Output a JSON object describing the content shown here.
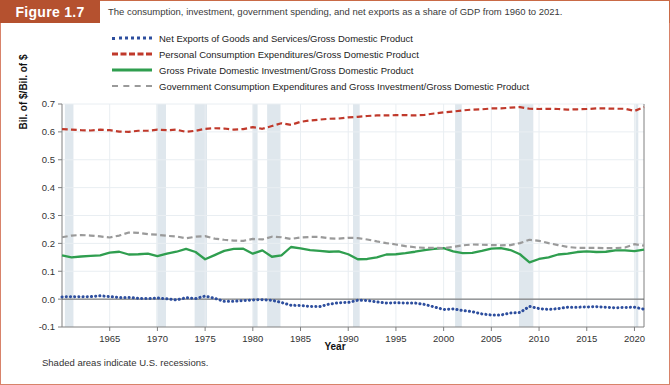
{
  "header": {
    "figure_tag": "Figure 1.7",
    "caption": "The consumption, investment, government spending, and net exports as a share of GDP from 1960 to 2021."
  },
  "footnote": "Shaded areas indicate U.S. recessions.",
  "colors": {
    "header_bg": "#b5512f",
    "frame_border": "#d8836a",
    "net_exports": "#2d4e9e",
    "consumption": "#c0392b",
    "investment": "#2f9e4f",
    "government": "#9a9a9a",
    "recession_band": "#dfe7ed",
    "gridline": "#e9eef2",
    "axis": "#808080"
  },
  "legend": {
    "position": "top",
    "items": [
      {
        "label": "Net Exports of Goods and Services/Gross Domestic Product",
        "style": "dotted",
        "color": "#2d4e9e",
        "swatch_class": "sw-dotted"
      },
      {
        "label": "Personal Consumption Expenditures/Gross Domestic Product",
        "style": "dashed",
        "color": "#c0392b",
        "swatch_class": "sw-dashed-red"
      },
      {
        "label": "Gross Private Domestic Investment/Gross Domestic Product",
        "style": "solid",
        "color": "#2f9e4f",
        "swatch_class": "sw-solid-green"
      },
      {
        "label": "Government Consumption Expenditures and Gross Investment/Gross Domestic Product",
        "style": "dashed",
        "color": "#9a9a9a",
        "swatch_class": "sw-dashed-gray"
      }
    ]
  },
  "chart_data": {
    "type": "line",
    "title": "The consumption, investment, government spending, and net exports as a share of GDP from 1960 to 2021.",
    "xlabel": "Year",
    "ylabel": "Bil. of $/Bil. of $",
    "xlim": [
      1960,
      2021
    ],
    "ylim": [
      -0.1,
      0.7
    ],
    "ytick_values": [
      -0.1,
      0.0,
      0.1,
      0.2,
      0.3,
      0.4,
      0.5,
      0.6,
      0.7
    ],
    "ytick_labels": [
      "-0.1",
      "0.0",
      "0.1",
      "0.2",
      "0.3",
      "0.4",
      "0.5",
      "0.6",
      "0.7"
    ],
    "xtick_values": [
      1965,
      1970,
      1975,
      1980,
      1985,
      1990,
      1995,
      2000,
      2005,
      2010,
      2015,
      2020
    ],
    "xtick_labels": [
      "1965",
      "1970",
      "1975",
      "1980",
      "1985",
      "1990",
      "1995",
      "2000",
      "2005",
      "2010",
      "2015",
      "2020"
    ],
    "grid": true,
    "legend_position": "above-plot",
    "x": [
      1960,
      1961,
      1962,
      1963,
      1964,
      1965,
      1966,
      1967,
      1968,
      1969,
      1970,
      1971,
      1972,
      1973,
      1974,
      1975,
      1976,
      1977,
      1978,
      1979,
      1980,
      1981,
      1982,
      1983,
      1984,
      1985,
      1986,
      1987,
      1988,
      1989,
      1990,
      1991,
      1992,
      1993,
      1994,
      1995,
      1996,
      1997,
      1998,
      1999,
      2000,
      2001,
      2002,
      2003,
      2004,
      2005,
      2006,
      2007,
      2008,
      2009,
      2010,
      2011,
      2012,
      2013,
      2014,
      2015,
      2016,
      2017,
      2018,
      2019,
      2020,
      2021
    ],
    "series": [
      {
        "name": "Net Exports of Goods and Services/Gross Domestic Product",
        "color": "#2d4e9e",
        "style": "dotted",
        "values": [
          0.008,
          0.009,
          0.008,
          0.009,
          0.012,
          0.009,
          0.006,
          0.006,
          0.003,
          0.002,
          0.004,
          0.001,
          -0.003,
          0.005,
          0.002,
          0.011,
          0.003,
          -0.008,
          -0.008,
          -0.005,
          -0.003,
          -0.002,
          -0.004,
          -0.012,
          -0.022,
          -0.023,
          -0.026,
          -0.027,
          -0.018,
          -0.013,
          -0.012,
          -0.004,
          -0.005,
          -0.01,
          -0.014,
          -0.013,
          -0.014,
          -0.014,
          -0.019,
          -0.028,
          -0.037,
          -0.035,
          -0.041,
          -0.045,
          -0.053,
          -0.057,
          -0.057,
          -0.05,
          -0.048,
          -0.026,
          -0.034,
          -0.037,
          -0.034,
          -0.029,
          -0.029,
          -0.028,
          -0.027,
          -0.029,
          -0.031,
          -0.03,
          -0.029,
          -0.036
        ]
      },
      {
        "name": "Personal Consumption Expenditures/Gross Domestic Product",
        "color": "#c0392b",
        "style": "dashed",
        "values": [
          0.61,
          0.608,
          0.606,
          0.605,
          0.608,
          0.606,
          0.601,
          0.6,
          0.604,
          0.604,
          0.608,
          0.606,
          0.608,
          0.6,
          0.604,
          0.611,
          0.613,
          0.612,
          0.608,
          0.61,
          0.617,
          0.611,
          0.621,
          0.631,
          0.625,
          0.636,
          0.641,
          0.644,
          0.647,
          0.648,
          0.652,
          0.654,
          0.657,
          0.659,
          0.659,
          0.66,
          0.66,
          0.659,
          0.661,
          0.666,
          0.67,
          0.673,
          0.677,
          0.68,
          0.681,
          0.684,
          0.684,
          0.687,
          0.689,
          0.683,
          0.682,
          0.683,
          0.682,
          0.68,
          0.681,
          0.682,
          0.684,
          0.684,
          0.683,
          0.683,
          0.675,
          0.689
        ]
      },
      {
        "name": "Gross Private Domestic Investment/Gross Domestic Product",
        "color": "#2f9e4f",
        "style": "solid",
        "values": [
          0.157,
          0.15,
          0.153,
          0.155,
          0.157,
          0.167,
          0.17,
          0.16,
          0.161,
          0.163,
          0.154,
          0.163,
          0.17,
          0.18,
          0.169,
          0.143,
          0.158,
          0.173,
          0.18,
          0.181,
          0.163,
          0.175,
          0.152,
          0.157,
          0.187,
          0.182,
          0.176,
          0.173,
          0.17,
          0.171,
          0.161,
          0.143,
          0.144,
          0.15,
          0.16,
          0.161,
          0.165,
          0.17,
          0.176,
          0.18,
          0.183,
          0.171,
          0.165,
          0.166,
          0.173,
          0.181,
          0.183,
          0.176,
          0.161,
          0.132,
          0.144,
          0.15,
          0.16,
          0.163,
          0.169,
          0.171,
          0.169,
          0.17,
          0.175,
          0.175,
          0.172,
          0.178
        ]
      },
      {
        "name": "Government Consumption Expenditures and Gross Investment/Gross Domestic Product",
        "color": "#9a9a9a",
        "style": "dashed",
        "values": [
          0.222,
          0.228,
          0.23,
          0.228,
          0.225,
          0.221,
          0.228,
          0.239,
          0.238,
          0.233,
          0.231,
          0.227,
          0.225,
          0.218,
          0.224,
          0.226,
          0.217,
          0.213,
          0.21,
          0.209,
          0.216,
          0.214,
          0.224,
          0.222,
          0.216,
          0.221,
          0.223,
          0.223,
          0.218,
          0.217,
          0.22,
          0.219,
          0.214,
          0.207,
          0.201,
          0.196,
          0.19,
          0.186,
          0.184,
          0.184,
          0.183,
          0.187,
          0.193,
          0.196,
          0.195,
          0.194,
          0.193,
          0.194,
          0.201,
          0.213,
          0.209,
          0.201,
          0.194,
          0.187,
          0.184,
          0.184,
          0.184,
          0.183,
          0.183,
          0.185,
          0.197,
          0.192
        ]
      }
    ],
    "recessions": [
      {
        "start": 1960.3,
        "end": 1961.2
      },
      {
        "start": 1969.9,
        "end": 1970.9
      },
      {
        "start": 1973.9,
        "end": 1975.2
      },
      {
        "start": 1980.0,
        "end": 1980.5
      },
      {
        "start": 1981.5,
        "end": 1982.9
      },
      {
        "start": 1990.5,
        "end": 1991.2
      },
      {
        "start": 2001.2,
        "end": 2001.9
      },
      {
        "start": 2007.9,
        "end": 2009.4
      },
      {
        "start": 2020.1,
        "end": 2020.4
      }
    ]
  }
}
